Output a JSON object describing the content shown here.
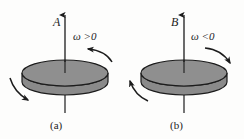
{
  "figure": {
    "type": "physics-diagram",
    "background_color": "#fdfdfc",
    "disk_fill_color": "#8c8c8c",
    "disk_side_color": "#8a8a8a",
    "stroke_color": "#1c1c1c",
    "panels": [
      {
        "caption": "(a)",
        "vector_label": "A",
        "omega_label": "ω >0",
        "omega_sign": "positive",
        "vector_direction": "up",
        "rotation_sense": "counterclockwise-from-above",
        "arrow_top_right_direction": "left",
        "arrow_bottom_left_direction": "down-right"
      },
      {
        "caption": "(b)",
        "vector_label": "B",
        "omega_label": "ω <0",
        "omega_sign": "negative",
        "vector_direction": "up",
        "rotation_sense": "clockwise-from-above",
        "arrow_top_right_direction": "down-right",
        "arrow_bottom_left_direction": "up-left"
      }
    ]
  }
}
